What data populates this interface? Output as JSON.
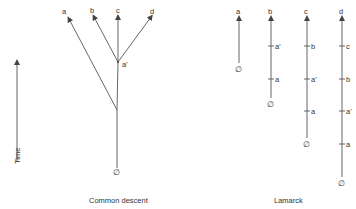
{
  "axis": {
    "label": "Time"
  },
  "common_descent": {
    "caption": "Common descent",
    "root_label": "∅",
    "node_label": "a'",
    "tips": [
      "a",
      "b",
      "c",
      "d"
    ]
  },
  "lamarck": {
    "caption": "Lamarck",
    "root_label": "∅",
    "lineages": [
      {
        "tip": "a",
        "ancestors": []
      },
      {
        "tip": "b",
        "ancestors": [
          "a'",
          "a"
        ]
      },
      {
        "tip": "c",
        "ancestors": [
          "b",
          "a'",
          "a"
        ]
      },
      {
        "tip": "d",
        "ancestors": [
          "c",
          "b",
          "a'",
          "a"
        ]
      }
    ]
  },
  "colors": {
    "line": "#555555",
    "text": "#333333"
  }
}
